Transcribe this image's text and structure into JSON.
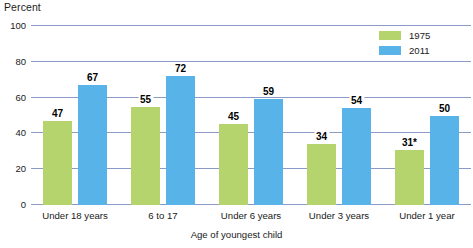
{
  "chart_data": {
    "type": "bar",
    "title": "",
    "ylabel": "Percent",
    "xlabel": "Age of youngest child",
    "categories": [
      "Under 18 years",
      "6 to 17",
      "Under 6 years",
      "Under 3 years",
      "Under 1 year"
    ],
    "series": [
      {
        "name": "1975",
        "color": "#b6d46d",
        "values": [
          47,
          55,
          45,
          34,
          31
        ],
        "value_labels": [
          "47",
          "55",
          "45",
          "34",
          "31*"
        ]
      },
      {
        "name": "2011",
        "color": "#57b3e8",
        "values": [
          67,
          72,
          59,
          54,
          50
        ],
        "value_labels": [
          "67",
          "72",
          "59",
          "54",
          "50"
        ]
      }
    ],
    "ylim": [
      0,
      100
    ],
    "yticks": [
      0,
      20,
      40,
      60,
      80,
      100
    ],
    "ytick_labels": [
      "0",
      "20",
      "40",
      "60",
      "80",
      "100"
    ],
    "grid": true,
    "legend_position": "top-right",
    "gridline_color": "#8b9ac6",
    "footnote_marker": "*"
  }
}
